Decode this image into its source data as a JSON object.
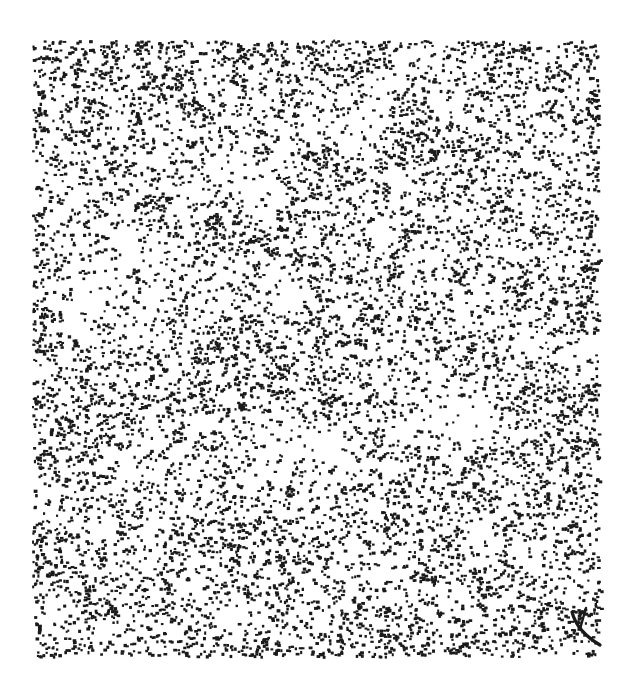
{
  "page": {
    "width": 632,
    "height": 678,
    "background_color": "#ffffff",
    "media": "scanned-print",
    "title": "",
    "caption": ""
  },
  "figure": {
    "name": "stipple-dot-density-plot",
    "ink_color": "#1a1a1a",
    "paper_color": "#ffffff"
  },
  "chart_data": {
    "type": "scatter",
    "title": "",
    "subtitle": "",
    "xlabel": "",
    "ylabel": "",
    "xlim": [
      32,
      598
    ],
    "ylim": [
      40,
      656
    ],
    "grid": false,
    "legend": null,
    "tick_labels_x": [],
    "tick_labels_y": [],
    "annotations": [
      {
        "name": "corner-pen-stroke",
        "kind": "stroke",
        "x1": 572,
        "y1": 612,
        "x2": 600,
        "y2": 645,
        "note": "short dark diagonal ink mark near lower-right corner"
      }
    ],
    "marker": {
      "shape": "square-dot",
      "size_px": 2.6,
      "color": "#1a1a1a"
    },
    "field": {
      "n_points": 13500,
      "plot_left": 32,
      "plot_top": 40,
      "plot_right": 598,
      "plot_bottom": 656,
      "base_density": 0.62,
      "edge_band_px": 34,
      "edge_density_boost": 0.95,
      "seed": 20240617
    },
    "density_blobs": [
      {
        "x": 120,
        "y": 270,
        "rx": 95,
        "ry": 80,
        "delta": -0.42
      },
      {
        "x": 250,
        "y": 175,
        "rx": 70,
        "ry": 60,
        "delta": -0.3
      },
      {
        "x": 352,
        "y": 118,
        "rx": 58,
        "ry": 50,
        "delta": -0.26
      },
      {
        "x": 300,
        "y": 300,
        "rx": 52,
        "ry": 46,
        "delta": -0.34
      },
      {
        "x": 470,
        "y": 300,
        "rx": 62,
        "ry": 58,
        "delta": -0.22
      },
      {
        "x": 448,
        "y": 430,
        "rx": 78,
        "ry": 58,
        "delta": -0.46
      },
      {
        "x": 300,
        "y": 470,
        "rx": 96,
        "ry": 72,
        "delta": -0.36
      },
      {
        "x": 150,
        "y": 520,
        "rx": 70,
        "ry": 55,
        "delta": -0.24
      },
      {
        "x": 470,
        "y": 560,
        "rx": 55,
        "ry": 45,
        "delta": -0.22
      },
      {
        "x": 210,
        "y": 620,
        "rx": 60,
        "ry": 40,
        "delta": -0.2
      },
      {
        "x": 545,
        "y": 175,
        "rx": 55,
        "ry": 60,
        "delta": -0.18
      },
      {
        "x": 90,
        "y": 150,
        "rx": 45,
        "ry": 40,
        "delta": -0.2
      },
      {
        "x": 195,
        "y": 120,
        "rx": 40,
        "ry": 45,
        "delta": 0.34
      },
      {
        "x": 300,
        "y": 205,
        "rx": 34,
        "ry": 75,
        "delta": 0.38
      },
      {
        "x": 430,
        "y": 150,
        "rx": 50,
        "ry": 60,
        "delta": 0.3
      },
      {
        "x": 318,
        "y": 335,
        "rx": 26,
        "ry": 70,
        "delta": 0.52
      },
      {
        "x": 385,
        "y": 255,
        "rx": 42,
        "ry": 44,
        "delta": 0.24
      },
      {
        "x": 225,
        "y": 395,
        "rx": 60,
        "ry": 36,
        "delta": 0.28
      },
      {
        "x": 392,
        "y": 500,
        "rx": 44,
        "ry": 62,
        "delta": 0.3
      },
      {
        "x": 548,
        "y": 470,
        "rx": 46,
        "ry": 70,
        "delta": 0.32
      },
      {
        "x": 110,
        "y": 440,
        "rx": 42,
        "ry": 40,
        "delta": 0.26
      },
      {
        "x": 520,
        "y": 95,
        "rx": 50,
        "ry": 42,
        "delta": 0.28
      },
      {
        "x": 265,
        "y": 560,
        "rx": 70,
        "ry": 34,
        "delta": 0.26
      },
      {
        "x": 160,
        "y": 340,
        "rx": 38,
        "ry": 34,
        "delta": 0.22
      },
      {
        "x": 488,
        "y": 640,
        "rx": 60,
        "ry": 28,
        "delta": 0.3
      }
    ],
    "density_bands": [
      {
        "angle_deg": 28,
        "wavelength": 58,
        "amplitude": 0.13,
        "phase": 0.4
      },
      {
        "angle_deg": -62,
        "wavelength": 92,
        "amplitude": 0.1,
        "phase": 1.9
      },
      {
        "angle_deg": 75,
        "wavelength": 150,
        "amplitude": 0.08,
        "phase": 3.1
      }
    ]
  }
}
